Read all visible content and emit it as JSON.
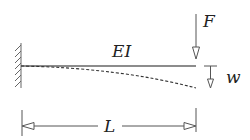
{
  "diagram": {
    "type": "cantilever-beam",
    "labels": {
      "force": "F",
      "stiffness": "EI",
      "deflection": "w",
      "length": "L"
    },
    "colors": {
      "stroke": "#555555",
      "text": "#222222",
      "background": "#ffffff"
    }
  }
}
